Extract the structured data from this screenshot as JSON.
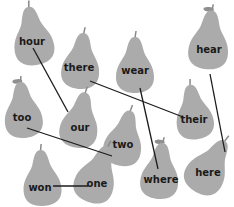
{
  "colors": {
    "pear_body": "#ababab",
    "pear_stem": "#8a8a8a",
    "leaf": "#8f8f8f",
    "line": "#1c1c1c",
    "text": "#1a1a1a",
    "background": "#ffffff"
  },
  "pears": [
    {
      "id": "hour",
      "word": "hour",
      "leaf": false
    },
    {
      "id": "there",
      "word": "there",
      "leaf": false
    },
    {
      "id": "wear",
      "word": "wear",
      "leaf": false
    },
    {
      "id": "hear",
      "word": "hear",
      "leaf": true
    },
    {
      "id": "too",
      "word": "too",
      "leaf": true
    },
    {
      "id": "our",
      "word": "our",
      "leaf": false
    },
    {
      "id": "two",
      "word": "two",
      "leaf": false
    },
    {
      "id": "their",
      "word": "their",
      "leaf": false
    },
    {
      "id": "won",
      "word": "won",
      "leaf": false
    },
    {
      "id": "one",
      "word": "one",
      "leaf": false
    },
    {
      "id": "where",
      "word": "where",
      "leaf": true
    },
    {
      "id": "here",
      "word": "here",
      "leaf": false
    }
  ],
  "matches": [
    {
      "from": "hour",
      "to": "our"
    },
    {
      "from": "there",
      "to": "their"
    },
    {
      "from": "wear",
      "to": "where"
    },
    {
      "from": "hear",
      "to": "here"
    },
    {
      "from": "too",
      "to": "two"
    },
    {
      "from": "won",
      "to": "one"
    }
  ]
}
